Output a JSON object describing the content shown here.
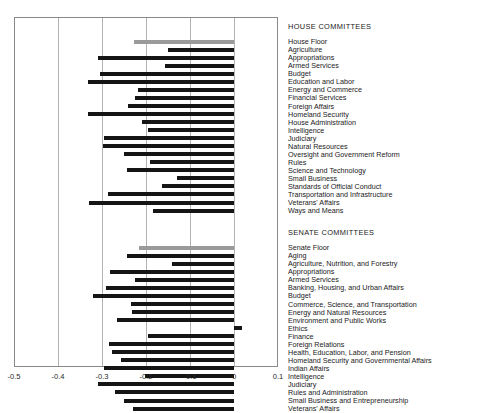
{
  "chart_data": {
    "type": "bar",
    "orientation": "horizontal",
    "title": "",
    "xlabel": "",
    "ylabel": "",
    "xlim": [
      -0.5,
      0.1
    ],
    "xticks": [
      -0.5,
      -0.4,
      -0.3,
      -0.2,
      -0.1,
      0,
      0.1
    ],
    "xticklabels": [
      "-0.5",
      "-0.4",
      "-0.3",
      "-0.2",
      "-0.1",
      "0",
      "0.1"
    ],
    "grid": true,
    "grid_axis": "x",
    "legend": "none",
    "colors": {
      "bar": "#151515",
      "floor_bar": "#9a9a9a",
      "gridline": "#b4b4b4",
      "frame": "#8a8a8a",
      "text": "#1a1a1a"
    },
    "groups": [
      {
        "name": "HOUSE COMMITTEES",
        "categories": [
          "House Floor",
          "Agriculture",
          "Appropriations",
          "Armed Services",
          "Budget",
          "Education and Labor",
          "Energy and Commerce",
          "Financial Services",
          "Foreign Affairs",
          "Homeland Security",
          "House Administration",
          "Intelligence",
          "Judiciary",
          "Natural Resources",
          "Oversight and Government Reform",
          "Rules",
          "Science and Technology",
          "Small Business",
          "Standards of Official Conduct",
          "Transportation and Infrastructure",
          "Veterans' Affairs",
          "Ways and Means"
        ],
        "values": [
          -0.228,
          -0.149,
          -0.309,
          -0.156,
          -0.305,
          -0.332,
          -0.218,
          -0.225,
          -0.24,
          -0.332,
          -0.208,
          -0.196,
          -0.296,
          -0.297,
          -0.249,
          -0.192,
          -0.244,
          -0.13,
          -0.163,
          -0.286,
          -0.329,
          -0.185
        ],
        "floor_index": 0
      },
      {
        "name": "SENATE COMMITTEES",
        "categories": [
          "Senate Floor",
          "Aging",
          "Agriculture, Nutrition, and Forestry",
          "Appropriations",
          "Armed Services",
          "Banking, Housing, and Urban Affairs",
          "Budget",
          "Commerce, Science, and Transportation",
          "Energy and Natural Resources",
          "Environment and Public Works",
          "Ethics",
          "Finance",
          "Foreign Relations",
          "Health, Education, Labor, and Pension",
          "Homeland Security and Governmental Affairs",
          "Indian Affairs",
          "Intelligence",
          "Judiciary",
          "Rules and Administration",
          "Small Business and Entrepreneurship",
          "Veterans' Affairs"
        ],
        "values": [
          -0.216,
          -0.243,
          -0.142,
          -0.282,
          -0.225,
          -0.29,
          -0.32,
          -0.233,
          -0.232,
          -0.265,
          0.018,
          -0.195,
          -0.285,
          -0.277,
          -0.257,
          -0.296,
          -0.202,
          -0.31,
          -0.271,
          -0.249,
          -0.23
        ],
        "floor_index": 0
      }
    ]
  }
}
